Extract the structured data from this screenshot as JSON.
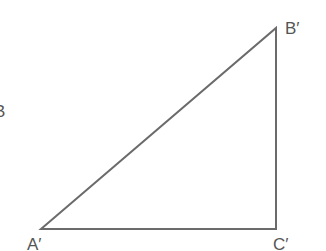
{
  "diagram": {
    "type": "right-triangle",
    "stroke_color": "#6b6b6b",
    "label_color": "#555555",
    "vertices": [
      {
        "name": "A′",
        "x": 41,
        "y": 229
      },
      {
        "name": "B′",
        "x": 276,
        "y": 28
      },
      {
        "name": "C′",
        "x": 276,
        "y": 229
      }
    ],
    "labels": {
      "a": "A′",
      "b": "B′",
      "c": "C′",
      "partial_left": "B"
    }
  }
}
